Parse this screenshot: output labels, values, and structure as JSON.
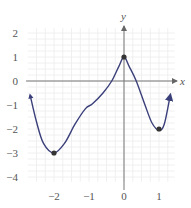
{
  "chart_data": {
    "type": "line",
    "title": "",
    "xlabel": "x",
    "ylabel": "y",
    "xlim": [
      -2.75,
      1.45
    ],
    "ylim": [
      -4.2,
      2.2
    ],
    "x_ticks": [
      "-2",
      "-1",
      "0",
      "1"
    ],
    "y_ticks": [
      "2",
      "1",
      "0",
      "-1",
      "-2",
      "-3",
      "-4"
    ],
    "grid": true,
    "series": [
      {
        "name": "f(x)",
        "color": "#3a3f7a",
        "x": [
          -2.68,
          -2.5,
          -2.3,
          -2.0,
          -1.7,
          -1.4,
          -1.1,
          -0.9,
          -0.6,
          -0.35,
          -0.15,
          0.0,
          0.15,
          0.35,
          0.6,
          0.8,
          1.0,
          1.15,
          1.32
        ],
        "y": [
          -0.6,
          -1.7,
          -2.6,
          -3.0,
          -2.6,
          -1.8,
          -1.15,
          -0.95,
          -0.5,
          0.0,
          0.6,
          1.0,
          0.6,
          0.0,
          -1.0,
          -1.75,
          -2.05,
          -1.8,
          -0.6
        ],
        "marked_points": [
          {
            "x": -2,
            "y": -3
          },
          {
            "x": 0,
            "y": 1
          },
          {
            "x": 1,
            "y": -2
          }
        ],
        "end_arrows": true
      }
    ]
  }
}
